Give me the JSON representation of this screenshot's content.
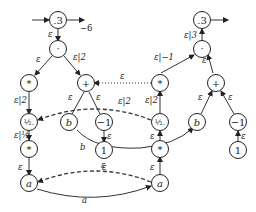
{
  "diagram": {
    "left_tree": {
      "root": ".3",
      "root_out_label": "−6",
      "nodes": {
        "root": ".3",
        "dot": "·",
        "star1": "*",
        "plus": "+",
        "half": "½.",
        "b": "b",
        "neg1": "−1",
        "star2": "*",
        "one": "1",
        "a": "a"
      },
      "edge_labels": {
        "root_dot": "ε",
        "dot_star1": "ε",
        "dot_plus": "ε|2",
        "star1_half": "ε|2",
        "plus_b": "ε",
        "plus_neg1": "ε",
        "half_star2": "ε|½",
        "neg1_one": "ε",
        "star2_a": "ε"
      }
    },
    "right_tree": {
      "nodes": {
        "root": ".3",
        "dot": "·",
        "star1": "*",
        "plus": "+",
        "half": "½.",
        "b": "b",
        "neg1": "−1",
        "star2": "*",
        "one": "1",
        "a": "a"
      },
      "edge_labels": {
        "dot_root": "ε|3",
        "star1_dot": "ε|−1",
        "plus_dot": "ε",
        "half_star1": "ε|2",
        "b_plus": "ε",
        "neg1_plus": "ε",
        "star2_half": "ε",
        "one_neg1": "ε",
        "a_star2": "ε"
      }
    },
    "cross_edges": {
      "star_to_plus_dotted": "ε",
      "half_dashed": "ε|2",
      "b_solid": "b",
      "a_dashed": "ε",
      "a_solid": "a"
    }
  }
}
